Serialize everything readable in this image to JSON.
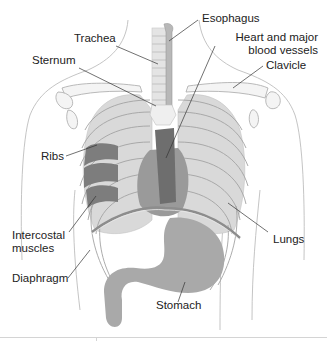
{
  "figure": {
    "labels": [
      {
        "id": "esophagus",
        "text": "Esophagus"
      },
      {
        "id": "trachea",
        "text": "Trachea"
      },
      {
        "id": "heart",
        "line1": "Heart and major",
        "line2": "blood vessels"
      },
      {
        "id": "sternum",
        "text": "Sternum"
      },
      {
        "id": "clavicle",
        "text": "Clavicle"
      },
      {
        "id": "ribs",
        "text": "Ribs"
      },
      {
        "id": "intercostal",
        "line1": "Intercostal",
        "line2": "muscles"
      },
      {
        "id": "lungs",
        "text": "Lungs"
      },
      {
        "id": "diaphragm",
        "text": "Diaphragm"
      },
      {
        "id": "stomach",
        "text": "Stomach"
      }
    ],
    "colors": {
      "outline": "#a8a8a8",
      "lung_fill": "#d9d9d9",
      "rib_fill": "#e9e9e9",
      "heart_dark": "#6e6e6e",
      "heart_mid": "#9a9a9a",
      "stomach": "#a9a9a9",
      "intercostal": "#7d7d7d",
      "leader": "#333333"
    }
  }
}
